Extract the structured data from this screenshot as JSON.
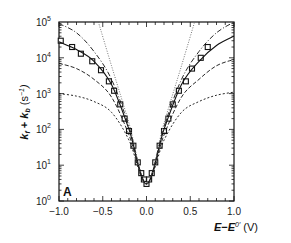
{
  "chart_data": {
    "type": "line",
    "title": "",
    "panel_label": "A",
    "xlabel": "E−E0′ (V)",
    "ylabel": "k_f + k_b (s⁻¹)",
    "xlim": [
      -1.0,
      1.0
    ],
    "ylim": [
      1,
      100000
    ],
    "yscale": "log",
    "grid": false,
    "legend": null,
    "x_ticks": [
      "−1.0",
      "−0.5",
      "0.0",
      "0.5",
      "1.0"
    ],
    "y_ticks": [
      "10^0",
      "10^1",
      "10^2",
      "10^3",
      "10^4",
      "10^5"
    ],
    "series": [
      {
        "name": "data (squares)",
        "style": "markers",
        "x": [
          -0.98,
          -0.85,
          -0.75,
          -0.62,
          -0.52,
          -0.43,
          -0.37,
          -0.3,
          -0.25,
          -0.2,
          -0.15,
          -0.1,
          -0.06,
          -0.03,
          0.0,
          0.03,
          0.06,
          0.1,
          0.15,
          0.2,
          0.25,
          0.3,
          0.37,
          0.45,
          0.52,
          0.62,
          0.7
        ],
        "y": [
          30000,
          20000,
          13000,
          8000,
          4500,
          2200,
          1200,
          500,
          200,
          90,
          35,
          12,
          6,
          4,
          3,
          4,
          6,
          12,
          35,
          90,
          200,
          500,
          1200,
          2200,
          5000,
          10000,
          20000
        ]
      },
      {
        "name": "fit (solid)",
        "style": "solid",
        "x": [
          -1.0,
          -0.8,
          -0.6,
          -0.4,
          -0.2,
          0.0,
          0.2,
          0.4,
          0.6,
          0.8,
          1.0
        ],
        "y": [
          28000,
          17000,
          8000,
          1800,
          100,
          3,
          100,
          1800,
          8000,
          22000,
          40000
        ]
      },
      {
        "name": "dash-dot (high)",
        "style": "dashdot",
        "x": [
          -1.0,
          -0.8,
          -0.6,
          -0.4,
          -0.2,
          0.0,
          0.2,
          0.4,
          0.6,
          0.8,
          1.0
        ],
        "y": [
          90000,
          50000,
          15000,
          2500,
          120,
          3,
          120,
          2500,
          15000,
          50000,
          100000
        ]
      },
      {
        "name": "dash (mid)",
        "style": "dashed",
        "x": [
          -1.0,
          -0.8,
          -0.6,
          -0.4,
          -0.2,
          0.0,
          0.2,
          0.4,
          0.6,
          0.8,
          1.0
        ],
        "y": [
          7000,
          5000,
          2500,
          800,
          70,
          3,
          70,
          800,
          2500,
          6000,
          9000
        ]
      },
      {
        "name": "short dash (low)",
        "style": "shortdash",
        "x": [
          -1.0,
          -0.8,
          -0.6,
          -0.4,
          -0.2,
          0.0,
          0.2,
          0.4,
          0.6,
          0.8,
          1.0
        ],
        "y": [
          1000,
          850,
          600,
          300,
          50,
          3,
          50,
          300,
          600,
          900,
          1100
        ]
      },
      {
        "name": "dotted (linear Marcus)",
        "style": "dotted",
        "x": [
          -0.55,
          -0.4,
          -0.2,
          0.0,
          0.2,
          0.4,
          0.55
        ],
        "y": [
          100000,
          6000,
          150,
          3,
          150,
          6000,
          100000
        ]
      }
    ]
  }
}
